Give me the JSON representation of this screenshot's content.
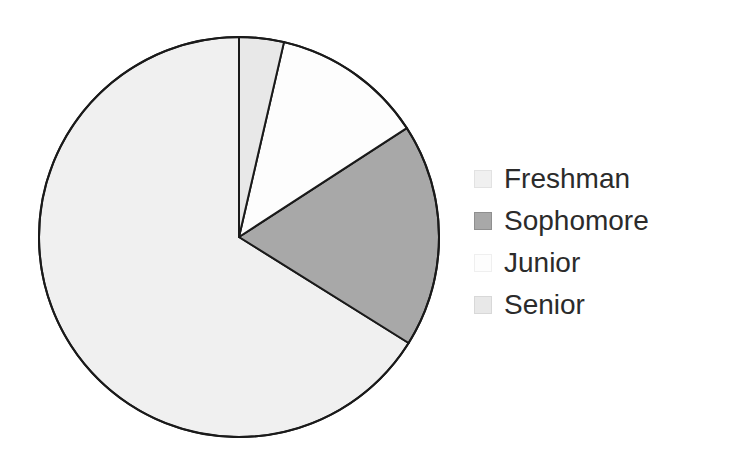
{
  "chart_data": {
    "type": "pie",
    "title": "",
    "subtitle": "",
    "xlabel": "",
    "ylabel": "",
    "grid": false,
    "legend_position": "right",
    "start_angle_deg": 90,
    "direction": "counterclockwise",
    "center": {
      "x": 239,
      "y": 237
    },
    "radius": 200,
    "stroke_color": "#1a1a1a",
    "stroke_width": 2,
    "categories": [
      "Freshman",
      "Sophomore",
      "Junior",
      "Senior"
    ],
    "values": [
      66,
      18,
      12,
      4
    ],
    "units": "percent",
    "slices": [
      {
        "label": "Freshman",
        "value": 66,
        "sweep_deg": 238,
        "color": "#f0f0f0",
        "start_deg": 90,
        "end_deg": 328
      },
      {
        "label": "Sophomore",
        "value": 18,
        "sweep_deg": 65,
        "color": "#a8a8a8",
        "start_deg": 328,
        "end_deg": 33
      },
      {
        "label": "Junior",
        "value": 12,
        "sweep_deg": 44,
        "color": "#fdfdfd",
        "start_deg": 33,
        "end_deg": 77
      },
      {
        "label": "Senior",
        "value": 4,
        "sweep_deg": 13,
        "color": "#e8e8e8",
        "start_deg": 77,
        "end_deg": 90
      }
    ]
  },
  "legend": {
    "items": [
      {
        "label": "Freshman",
        "color": "#f0f0f0",
        "swatch_border": "#e2e2e2"
      },
      {
        "label": "Sophomore",
        "color": "#a8a8a8",
        "swatch_border": "#8f8f8f"
      },
      {
        "label": "Junior",
        "color": "#fdfdfd",
        "swatch_border": "#efefef"
      },
      {
        "label": "Senior",
        "color": "#e8e8e8",
        "swatch_border": "#d8d8d8"
      }
    ]
  }
}
